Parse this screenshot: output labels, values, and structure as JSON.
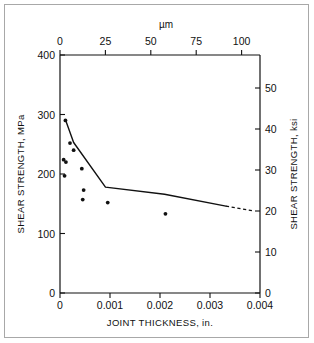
{
  "chart_data": {
    "type": "scatter",
    "title": "",
    "xlabel": "JOINT THICKNESS, in.",
    "ylabel": "SHEAR STRENGTH, MPa",
    "x2label": "µm",
    "y2label": "SHEAR STRENGTH, ksi",
    "xlim": [
      0,
      0.0044
    ],
    "ylim": [
      0,
      400
    ],
    "x2lim": [
      0,
      111.8
    ],
    "y2lim": [
      0,
      58.0
    ],
    "xticks": [
      0,
      0.001,
      0.002,
      0.003,
      0.004
    ],
    "xticklabels": [
      "0",
      "0.001",
      "0.002",
      "0.003",
      "0.004"
    ],
    "yticks": [
      0,
      100,
      200,
      300,
      400
    ],
    "yticklabels": [
      "0",
      "100",
      "200",
      "300",
      "400"
    ],
    "x2ticks": [
      0,
      25,
      50,
      75,
      100
    ],
    "x2ticklabels": [
      "0",
      "25",
      "50",
      "75",
      "100"
    ],
    "y2ticks": [
      0,
      10,
      20,
      30,
      40,
      50
    ],
    "y2ticklabels": [
      "0",
      "10",
      "20",
      "30",
      "40",
      "50"
    ],
    "grid": false,
    "legend": null,
    "series": [
      {
        "name": "measured data",
        "marker": "dot",
        "points": [
          {
            "x": 0.00012,
            "y": 290
          },
          {
            "x": 0.00022,
            "y": 252
          },
          {
            "x": 0.0003,
            "y": 240
          },
          {
            "x": 8e-05,
            "y": 224
          },
          {
            "x": 0.00013,
            "y": 220
          },
          {
            "x": 0.0001,
            "y": 197
          },
          {
            "x": 0.00048,
            "y": 209
          },
          {
            "x": 0.00052,
            "y": 173
          },
          {
            "x": 0.0005,
            "y": 157
          },
          {
            "x": 0.00105,
            "y": 152
          },
          {
            "x": 0.00232,
            "y": 133
          }
        ]
      },
      {
        "name": "trend line",
        "marker": "none",
        "style": "solid",
        "points": [
          {
            "x": 0.00013,
            "y": 289
          },
          {
            "x": 0.0003,
            "y": 253
          },
          {
            "x": 0.001,
            "y": 178
          },
          {
            "x": 0.0023,
            "y": 166
          },
          {
            "x": 0.00365,
            "y": 146
          }
        ]
      },
      {
        "name": "trend line extrapolation",
        "marker": "none",
        "style": "dashed",
        "points": [
          {
            "x": 0.00365,
            "y": 146
          },
          {
            "x": 0.00425,
            "y": 138
          }
        ]
      }
    ]
  },
  "axes": {
    "bottom_title": "JOINT THICKNESS, in.",
    "left_title": "SHEAR STRENGTH, MPa",
    "right_title": "SHEAR STRENGTH, ksi",
    "top_title": "µm"
  }
}
